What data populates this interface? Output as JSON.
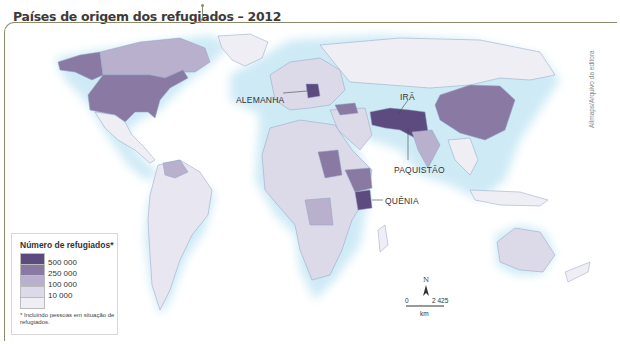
{
  "title": "Países de origem dos refugiados – 2012",
  "credit": "Allmaps/Arquivo da editora",
  "labels": {
    "germany": "ALEMANHA",
    "iran": "IRÃ",
    "pakistan": "PAQUISTÃO",
    "kenya": "QUÊNIA"
  },
  "legend": {
    "title": "Número de refugiados*",
    "items": [
      {
        "value": "500 000",
        "color": "#5d4a7e"
      },
      {
        "value": "250 000",
        "color": "#8a7aa3"
      },
      {
        "value": "100 000",
        "color": "#b8b0cc"
      },
      {
        "value": "10 000",
        "color": "#dcd9e8"
      }
    ],
    "lowest_color": "#efeef5",
    "note": "* Incluindo pessoas em situação de refugiados."
  },
  "scale": {
    "north": "N",
    "start": "0",
    "end": "2 425",
    "unit": "km"
  },
  "colors": {
    "ocean": "#ffffff",
    "coast_glow": "#bfe3f3",
    "border": "#8fa3c4",
    "frame": "#8b8a6a"
  }
}
